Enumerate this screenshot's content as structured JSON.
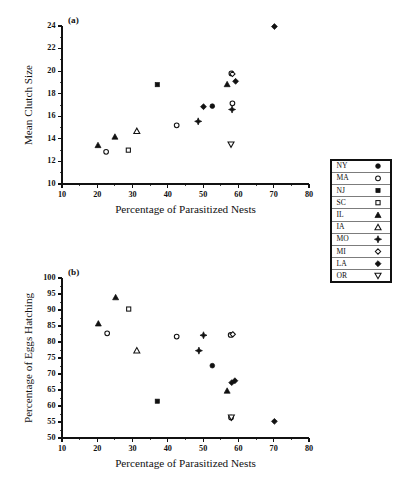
{
  "figure": {
    "background": "#ffffff",
    "ink_color": "#111111",
    "width": 397,
    "height": 489
  },
  "legend": {
    "name": "state-legend",
    "position": "right",
    "bordered": true,
    "entries": [
      {
        "label": "NY",
        "marker": "filled-circle"
      },
      {
        "label": "MA",
        "marker": "open-circle"
      },
      {
        "label": "NJ",
        "marker": "filled-square"
      },
      {
        "label": "SC",
        "marker": "open-square"
      },
      {
        "label": "IL",
        "marker": "filled-triangle"
      },
      {
        "label": "IA",
        "marker": "open-triangle"
      },
      {
        "label": "MO",
        "marker": "filled-cross-diamond"
      },
      {
        "label": "MI",
        "marker": "open-diamond"
      },
      {
        "label": "LA",
        "marker": "filled-diamond"
      },
      {
        "label": "OR",
        "marker": "open-inverted-triangle"
      }
    ]
  },
  "chart_data": [
    {
      "id": "panel-a",
      "type": "scatter",
      "panel_label": "(a)",
      "title": "",
      "xlabel": "Percentage of Parasitized Nests",
      "ylabel": "Mean Clutch Size",
      "xlim": [
        10,
        80
      ],
      "ylim": [
        10,
        24
      ],
      "xticks": [
        10,
        20,
        30,
        40,
        50,
        60,
        70,
        80
      ],
      "yticks": [
        10,
        12,
        14,
        16,
        18,
        20,
        22,
        24
      ],
      "xminor_step": 5,
      "yminor_step": 1,
      "grid": false,
      "legend_position": "outside-right",
      "series": [
        {
          "name": "NY",
          "marker": "filled-circle",
          "points": [
            [
              52.6,
              16.9
            ]
          ]
        },
        {
          "name": "MA",
          "marker": "open-circle",
          "points": [
            [
              22.5,
              12.85
            ],
            [
              42.5,
              15.2
            ],
            [
              58.0,
              19.8
            ],
            [
              58.3,
              17.15
            ]
          ]
        },
        {
          "name": "NJ",
          "marker": "filled-square",
          "points": [
            [
              37.0,
              18.8
            ]
          ]
        },
        {
          "name": "SC",
          "marker": "open-square",
          "points": [
            [
              28.8,
              13.0
            ]
          ]
        },
        {
          "name": "IL",
          "marker": "filled-triangle",
          "points": [
            [
              20.2,
              13.45
            ],
            [
              25.0,
              14.2
            ],
            [
              56.8,
              18.85
            ]
          ]
        },
        {
          "name": "IA",
          "marker": "open-triangle",
          "points": [
            [
              31.2,
              14.7
            ]
          ]
        },
        {
          "name": "MO",
          "marker": "filled-cross-diamond",
          "points": [
            [
              48.6,
              15.55
            ],
            [
              58.2,
              16.6
            ]
          ]
        },
        {
          "name": "MI",
          "marker": "open-diamond",
          "points": [
            [
              58.3,
              19.75
            ]
          ]
        },
        {
          "name": "LA",
          "marker": "filled-diamond",
          "points": [
            [
              50.1,
              16.85
            ],
            [
              59.2,
              19.1
            ],
            [
              70.2,
              23.95
            ]
          ]
        },
        {
          "name": "OR",
          "marker": "open-inverted-triangle",
          "points": [
            [
              57.9,
              13.5
            ]
          ]
        }
      ]
    },
    {
      "id": "panel-b",
      "type": "scatter",
      "panel_label": "(b)",
      "title": "",
      "xlabel": "Percentage of Parasitized Nests",
      "ylabel": "Percentage of Eggs Hatching",
      "xlim": [
        10,
        80
      ],
      "ylim": [
        50,
        100
      ],
      "xticks": [
        10,
        20,
        30,
        40,
        50,
        60,
        70,
        80
      ],
      "yticks": [
        50,
        55,
        60,
        65,
        70,
        75,
        80,
        85,
        90,
        95,
        100
      ],
      "xminor_step": 5,
      "yminor_step": 2.5,
      "grid": false,
      "legend_position": "outside-right",
      "series": [
        {
          "name": "NY",
          "marker": "filled-circle",
          "points": [
            [
              52.6,
              72.6
            ]
          ]
        },
        {
          "name": "MA",
          "marker": "open-circle",
          "points": [
            [
              22.8,
              82.7
            ],
            [
              42.5,
              81.7
            ],
            [
              57.8,
              82.2
            ],
            [
              57.9,
              56.4
            ]
          ]
        },
        {
          "name": "NJ",
          "marker": "filled-square",
          "points": [
            [
              37.0,
              61.5
            ]
          ]
        },
        {
          "name": "SC",
          "marker": "open-square",
          "points": [
            [
              28.9,
              90.3
            ]
          ]
        },
        {
          "name": "IL",
          "marker": "filled-triangle",
          "points": [
            [
              20.3,
              85.8
            ],
            [
              25.2,
              94.0
            ],
            [
              56.8,
              64.8
            ]
          ]
        },
        {
          "name": "IA",
          "marker": "open-triangle",
          "points": [
            [
              31.2,
              77.4
            ]
          ]
        },
        {
          "name": "MO",
          "marker": "filled-cross-diamond",
          "points": [
            [
              48.8,
              77.3
            ],
            [
              50.1,
              82.1
            ]
          ]
        },
        {
          "name": "MI",
          "marker": "open-diamond",
          "points": [
            [
              58.4,
              82.4
            ]
          ]
        },
        {
          "name": "LA",
          "marker": "filled-diamond",
          "points": [
            [
              58.1,
              67.3
            ],
            [
              59.0,
              67.9
            ],
            [
              70.2,
              55.2
            ]
          ]
        },
        {
          "name": "OR",
          "marker": "open-inverted-triangle",
          "points": [
            [
              58.0,
              56.4
            ]
          ]
        }
      ]
    }
  ]
}
